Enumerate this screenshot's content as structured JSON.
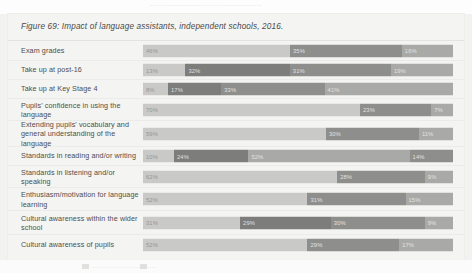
{
  "page": {
    "top_bleed_text": "............................................",
    "bottom_caption": "............................."
  },
  "figure": {
    "title": "Figure 69: Impact of language assistants, independent schools, 2016."
  },
  "chart_data": {
    "type": "bar",
    "subtype": "stacked-bar-horizontal-100pct",
    "title": "Figure 69: Impact of language assistants, independent schools, 2016.",
    "xlabel": "",
    "ylabel": "",
    "xlim": [
      0,
      100
    ],
    "grid": false,
    "legend_position": "bottom",
    "orientation": "horizontal",
    "categories": [
      "Exam grades",
      "Take up at post-16",
      "Take up at Key Stage 4",
      "Pupils' confidence in using the language",
      "Extending pupils' vocabulary and general understanding of the language",
      "Standards in reading and/or writing",
      "Standards in listening and/or speaking",
      "Enthusiasm/motivation for language learning",
      "Cultural awareness within the wider school",
      "Cultural awareness of pupils"
    ],
    "rows": [
      {
        "category": "Exam grades",
        "segments": [
          {
            "value": 46,
            "label": "46%",
            "shade": "light"
          },
          {
            "value": 35,
            "label": "35%",
            "shade": "dark"
          },
          {
            "value": 16,
            "label": "16%",
            "shade": "mid"
          }
        ]
      },
      {
        "category": "Take up at post-16",
        "segments": [
          {
            "value": 13,
            "label": "13%",
            "shade": "light"
          },
          {
            "value": 32,
            "label": "32%",
            "shade": "darker"
          },
          {
            "value": 31,
            "label": "31%",
            "shade": "dark"
          },
          {
            "value": 19,
            "label": "19%",
            "shade": "mid"
          }
        ]
      },
      {
        "category": "Take up at Key Stage 4",
        "segments": [
          {
            "value": 8,
            "label": "8%",
            "shade": "light"
          },
          {
            "value": 17,
            "label": "17%",
            "shade": "darker"
          },
          {
            "value": 33,
            "label": "33%",
            "shade": "dark"
          },
          {
            "value": 41,
            "label": "41%",
            "shade": "mid"
          }
        ]
      },
      {
        "category": "Pupils' confidence in using the language",
        "segments": [
          {
            "value": 70,
            "label": "70%",
            "shade": "light"
          },
          {
            "value": 23,
            "label": "23%",
            "shade": "dark"
          },
          {
            "value": 7,
            "label": "7%",
            "shade": "mid"
          }
        ]
      },
      {
        "category": "Extending pupils' vocabulary and general understanding of the language",
        "segments": [
          {
            "value": 59,
            "label": "59%",
            "shade": "light"
          },
          {
            "value": 30,
            "label": "30%",
            "shade": "dark"
          },
          {
            "value": 11,
            "label": "11%",
            "shade": "mid"
          }
        ]
      },
      {
        "category": "Standards in reading and/or writing",
        "segments": [
          {
            "value": 10,
            "label": "10%",
            "shade": "light"
          },
          {
            "value": 24,
            "label": "24%",
            "shade": "darker"
          },
          {
            "value": 52,
            "label": "52%",
            "shade": "mid"
          },
          {
            "value": 14,
            "label": "14%",
            "shade": "dark"
          }
        ]
      },
      {
        "category": "Standards in listening and/or speaking",
        "segments": [
          {
            "value": 62,
            "label": "62%",
            "shade": "light"
          },
          {
            "value": 28,
            "label": "28%",
            "shade": "dark"
          },
          {
            "value": 9,
            "label": "9%",
            "shade": "mid"
          }
        ]
      },
      {
        "category": "Enthusiasm/motivation for language learning",
        "segments": [
          {
            "value": 52,
            "label": "52%",
            "shade": "light"
          },
          {
            "value": 31,
            "label": "31%",
            "shade": "dark"
          },
          {
            "value": 15,
            "label": "15%",
            "shade": "mid"
          }
        ]
      },
      {
        "category": "Cultural awareness within the wider school",
        "segments": [
          {
            "value": 31,
            "label": "31%",
            "shade": "light"
          },
          {
            "value": 29,
            "label": "29%",
            "shade": "darker"
          },
          {
            "value": 30,
            "label": "30%",
            "shade": "dark"
          },
          {
            "value": 9,
            "label": "9%",
            "shade": "mid"
          }
        ]
      },
      {
        "category": "Cultural awareness of pupils",
        "segments": [
          {
            "value": 52,
            "label": "52%",
            "shade": "light"
          },
          {
            "value": 29,
            "label": "29%",
            "shade": "dark"
          },
          {
            "value": 17,
            "label": "17%",
            "shade": "mid"
          }
        ]
      }
    ]
  }
}
